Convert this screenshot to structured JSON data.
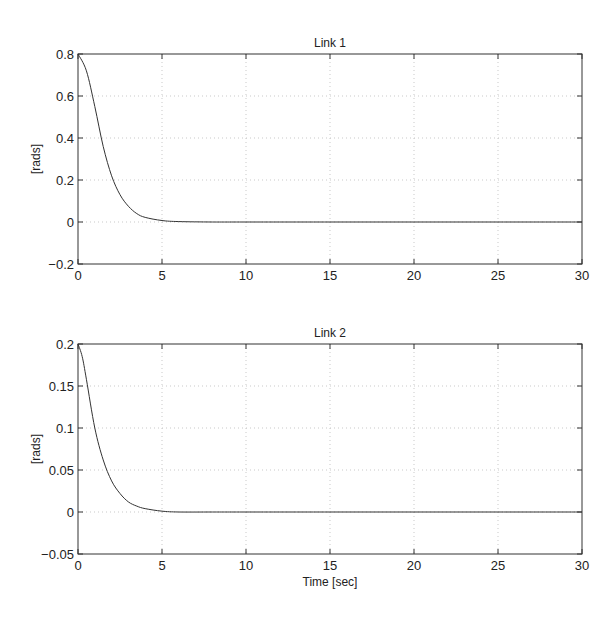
{
  "chart_data": [
    {
      "type": "line",
      "title": "Link 1",
      "xlabel": "",
      "ylabel": "[rads]",
      "xlim": [
        0,
        30
      ],
      "ylim": [
        -0.2,
        0.8
      ],
      "xticks": [
        0,
        5,
        10,
        15,
        20,
        25,
        30
      ],
      "yticks": [
        -0.2,
        0,
        0.2,
        0.4,
        0.6,
        0.8
      ],
      "ytick_labels": [
        "-0.2",
        "0",
        "0.2",
        "0.4",
        "0.6",
        "0.8"
      ],
      "grid": true,
      "series": [
        {
          "name": "Link 1",
          "x": [
            0,
            0.5,
            1,
            1.5,
            2,
            2.5,
            3,
            3.5,
            4,
            5,
            6,
            8,
            10,
            15,
            20,
            25,
            30
          ],
          "values": [
            0.8,
            0.72,
            0.55,
            0.36,
            0.22,
            0.13,
            0.075,
            0.04,
            0.022,
            0.007,
            0.002,
            0,
            0,
            0,
            0,
            0,
            0
          ]
        }
      ]
    },
    {
      "type": "line",
      "title": "Link 2",
      "xlabel": "Time [sec]",
      "ylabel": "[rads]",
      "xlim": [
        0,
        30
      ],
      "ylim": [
        -0.05,
        0.2
      ],
      "xticks": [
        0,
        5,
        10,
        15,
        20,
        25,
        30
      ],
      "yticks": [
        -0.05,
        0,
        0.05,
        0.1,
        0.15,
        0.2
      ],
      "ytick_labels": [
        "-0.05",
        "0",
        "0.05",
        "0.1",
        "0.15",
        "0.2"
      ],
      "grid": true,
      "series": [
        {
          "name": "Link 2",
          "x": [
            0,
            0.25,
            0.5,
            1,
            1.5,
            2,
            2.5,
            3,
            3.5,
            4,
            5,
            6,
            8,
            10,
            15,
            20,
            25,
            30
          ],
          "values": [
            0.2,
            0.185,
            0.158,
            0.1,
            0.062,
            0.037,
            0.022,
            0.012,
            0.007,
            0.004,
            0.001,
            0,
            0,
            0,
            0,
            0,
            0,
            0
          ]
        }
      ]
    }
  ]
}
